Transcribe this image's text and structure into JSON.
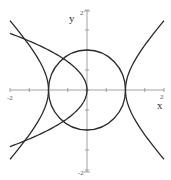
{
  "chart_data": {
    "type": "line",
    "title": "",
    "xlabel": "x",
    "ylabel": "y",
    "xlim": [
      -2,
      2
    ],
    "ylim": [
      -2,
      2
    ],
    "grid": false,
    "x_tick_labels": [
      "-2",
      "2"
    ],
    "y_tick_labels": [
      "2",
      "-2"
    ],
    "minor_tick_step": 0.5,
    "series": [
      {
        "name": "circle",
        "equation": "x^2 + y^2 = 1",
        "points": [
          [
            1,
            0
          ],
          [
            0,
            1
          ],
          [
            -1,
            0
          ],
          [
            0,
            -1
          ]
        ]
      },
      {
        "name": "hyperbola",
        "equation": "x^2 - y^2 = 1",
        "points": [
          [
            1,
            0
          ],
          [
            2,
            1.73
          ],
          [
            2,
            -1.73
          ],
          [
            -1,
            0
          ],
          [
            -2,
            1.73
          ],
          [
            -2,
            -1.73
          ]
        ]
      },
      {
        "name": "parabola",
        "equation": "x = -y^2",
        "points": [
          [
            0,
            0
          ],
          [
            -1,
            1
          ],
          [
            -1,
            -1
          ],
          [
            -1.96,
            1.4
          ],
          [
            -1.96,
            -1.4
          ]
        ]
      }
    ]
  },
  "labels": {
    "x_axis": "x",
    "y_axis": "y",
    "x_min": "-2",
    "x_max": "2",
    "y_max": "2",
    "y_min": "-2"
  }
}
